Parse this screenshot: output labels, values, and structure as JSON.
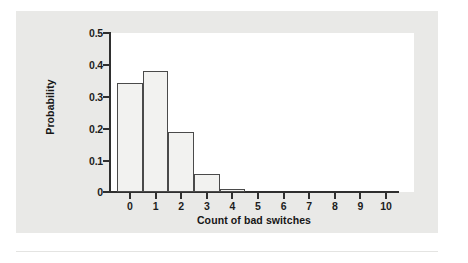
{
  "chart_data": {
    "type": "bar",
    "title": "",
    "subtitle": "",
    "xlabel": "Count of bad switches",
    "ylabel": "Probability",
    "categories": [
      "0",
      "1",
      "2",
      "3",
      "4",
      "5",
      "6",
      "7",
      "8",
      "9",
      "10"
    ],
    "values": [
      0.34,
      0.378,
      0.189,
      0.056,
      0.009,
      0,
      0,
      0,
      0,
      0,
      0
    ],
    "xlim": [
      -0.5,
      10.5
    ],
    "ylim": [
      0,
      0.5
    ],
    "ytick_labels": [
      "0.5",
      "0.4",
      "0.3",
      "0.2",
      "0.1",
      "0"
    ],
    "ytick_values": [
      0.5,
      0.4,
      0.3,
      0.2,
      0.1,
      0
    ],
    "xtick_labels": [
      "0",
      "1",
      "2",
      "3",
      "4",
      "5",
      "6",
      "7",
      "8",
      "9",
      "10"
    ],
    "grid": false,
    "legend": null,
    "annotations": [],
    "colors": {
      "bar_fill": "#f2f2f0",
      "bar_stroke": "#4a4a4a",
      "axis": "#2f2f2f",
      "text": "#161616",
      "panel_background": "#e9e9e7",
      "plot_background": "#ffffff"
    }
  }
}
